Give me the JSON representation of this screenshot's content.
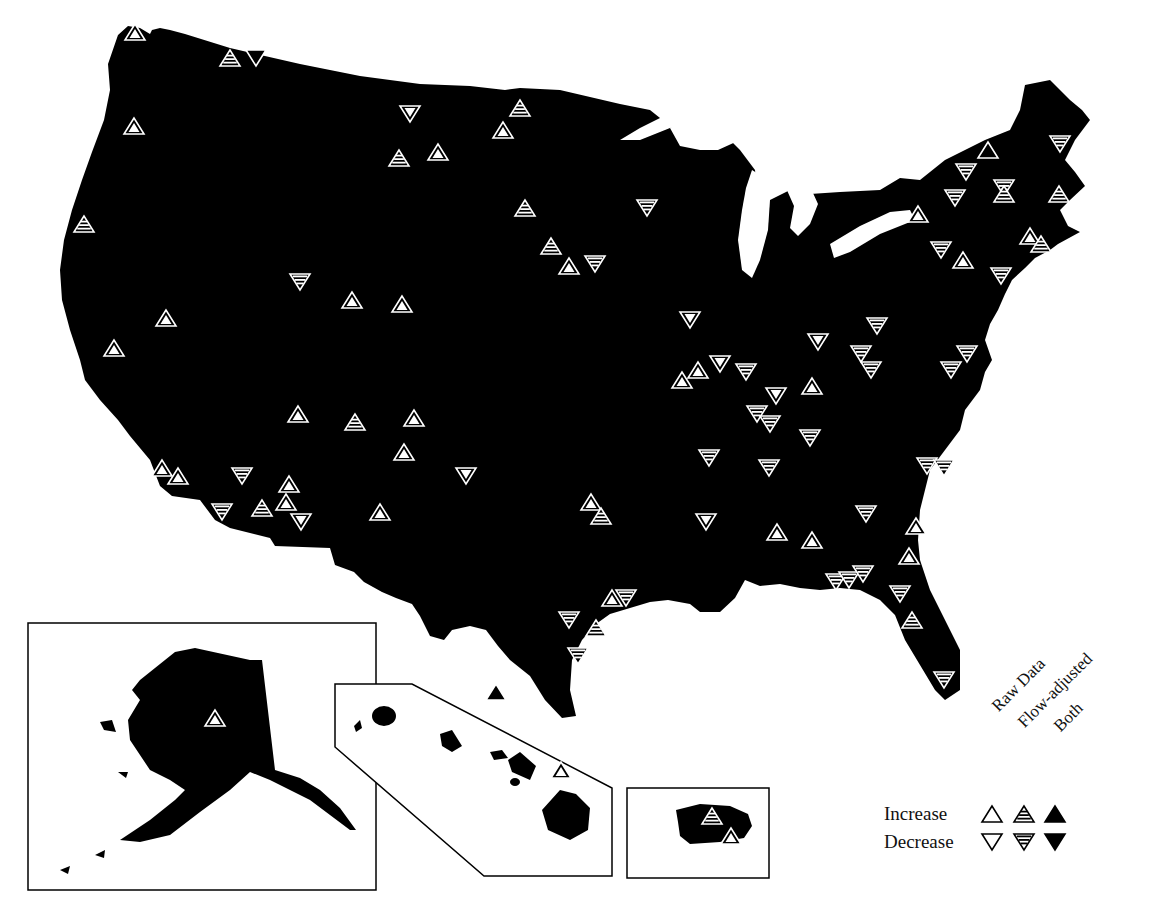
{
  "figure": {
    "type": "map",
    "region": "United States (with Alaska and Hawaii insets)"
  },
  "legend": {
    "columns": [
      "Raw Data",
      "Flow-adjusted",
      "Both"
    ],
    "rows": [
      "Increase",
      "Decrease"
    ]
  },
  "colors": {
    "land": "#000000",
    "background": "#ffffff",
    "marker_outline": "#ffffff"
  },
  "markers": [
    {
      "x": 135,
      "y": 32,
      "dir": "up",
      "kind": "raw"
    },
    {
      "x": 230,
      "y": 58,
      "dir": "up",
      "kind": "flow"
    },
    {
      "x": 256,
      "y": 58,
      "dir": "down",
      "kind": "both"
    },
    {
      "x": 134,
      "y": 126,
      "dir": "up",
      "kind": "raw"
    },
    {
      "x": 84,
      "y": 224,
      "dir": "up",
      "kind": "flow"
    },
    {
      "x": 410,
      "y": 114,
      "dir": "down",
      "kind": "raw"
    },
    {
      "x": 520,
      "y": 108,
      "dir": "up",
      "kind": "flow"
    },
    {
      "x": 503,
      "y": 130,
      "dir": "up",
      "kind": "raw"
    },
    {
      "x": 399,
      "y": 158,
      "dir": "up",
      "kind": "flow"
    },
    {
      "x": 438,
      "y": 152,
      "dir": "up",
      "kind": "raw"
    },
    {
      "x": 525,
      "y": 208,
      "dir": "up",
      "kind": "flow"
    },
    {
      "x": 647,
      "y": 208,
      "dir": "down",
      "kind": "flow"
    },
    {
      "x": 551,
      "y": 246,
      "dir": "up",
      "kind": "flow"
    },
    {
      "x": 569,
      "y": 266,
      "dir": "up",
      "kind": "raw"
    },
    {
      "x": 595,
      "y": 264,
      "dir": "down",
      "kind": "flow"
    },
    {
      "x": 300,
      "y": 282,
      "dir": "down",
      "kind": "flow"
    },
    {
      "x": 352,
      "y": 300,
      "dir": "up",
      "kind": "raw"
    },
    {
      "x": 402,
      "y": 304,
      "dir": "up",
      "kind": "raw"
    },
    {
      "x": 166,
      "y": 318,
      "dir": "up",
      "kind": "raw"
    },
    {
      "x": 114,
      "y": 348,
      "dir": "up",
      "kind": "raw"
    },
    {
      "x": 298,
      "y": 414,
      "dir": "up",
      "kind": "raw"
    },
    {
      "x": 355,
      "y": 422,
      "dir": "up",
      "kind": "flow"
    },
    {
      "x": 414,
      "y": 418,
      "dir": "up",
      "kind": "raw"
    },
    {
      "x": 404,
      "y": 452,
      "dir": "up",
      "kind": "raw"
    },
    {
      "x": 466,
      "y": 476,
      "dir": "down",
      "kind": "raw"
    },
    {
      "x": 162,
      "y": 468,
      "dir": "up",
      "kind": "raw"
    },
    {
      "x": 178,
      "y": 476,
      "dir": "up",
      "kind": "raw"
    },
    {
      "x": 242,
      "y": 476,
      "dir": "down",
      "kind": "flow"
    },
    {
      "x": 289,
      "y": 484,
      "dir": "up",
      "kind": "raw"
    },
    {
      "x": 262,
      "y": 508,
      "dir": "up",
      "kind": "flow"
    },
    {
      "x": 286,
      "y": 502,
      "dir": "up",
      "kind": "raw"
    },
    {
      "x": 222,
      "y": 512,
      "dir": "down",
      "kind": "flow"
    },
    {
      "x": 301,
      "y": 522,
      "dir": "down",
      "kind": "raw"
    },
    {
      "x": 380,
      "y": 512,
      "dir": "up",
      "kind": "raw"
    },
    {
      "x": 690,
      "y": 320,
      "dir": "down",
      "kind": "raw"
    },
    {
      "x": 682,
      "y": 380,
      "dir": "up",
      "kind": "raw"
    },
    {
      "x": 698,
      "y": 370,
      "dir": "up",
      "kind": "raw"
    },
    {
      "x": 720,
      "y": 364,
      "dir": "down",
      "kind": "raw"
    },
    {
      "x": 776,
      "y": 396,
      "dir": "down",
      "kind": "raw"
    },
    {
      "x": 746,
      "y": 372,
      "dir": "down",
      "kind": "flow"
    },
    {
      "x": 812,
      "y": 386,
      "dir": "up",
      "kind": "raw"
    },
    {
      "x": 818,
      "y": 342,
      "dir": "down",
      "kind": "raw"
    },
    {
      "x": 757,
      "y": 414,
      "dir": "down",
      "kind": "flow"
    },
    {
      "x": 770,
      "y": 424,
      "dir": "down",
      "kind": "flow"
    },
    {
      "x": 810,
      "y": 438,
      "dir": "down",
      "kind": "flow"
    },
    {
      "x": 709,
      "y": 458,
      "dir": "down",
      "kind": "flow"
    },
    {
      "x": 769,
      "y": 468,
      "dir": "down",
      "kind": "flow"
    },
    {
      "x": 591,
      "y": 502,
      "dir": "up",
      "kind": "raw"
    },
    {
      "x": 601,
      "y": 516,
      "dir": "up",
      "kind": "flow"
    },
    {
      "x": 706,
      "y": 522,
      "dir": "down",
      "kind": "raw"
    },
    {
      "x": 777,
      "y": 532,
      "dir": "up",
      "kind": "raw"
    },
    {
      "x": 812,
      "y": 540,
      "dir": "up",
      "kind": "raw"
    },
    {
      "x": 866,
      "y": 514,
      "dir": "down",
      "kind": "flow"
    },
    {
      "x": 877,
      "y": 326,
      "dir": "down",
      "kind": "flow"
    },
    {
      "x": 861,
      "y": 354,
      "dir": "down",
      "kind": "flow"
    },
    {
      "x": 871,
      "y": 370,
      "dir": "down",
      "kind": "flow"
    },
    {
      "x": 951,
      "y": 370,
      "dir": "down",
      "kind": "flow"
    },
    {
      "x": 967,
      "y": 354,
      "dir": "down",
      "kind": "flow"
    },
    {
      "x": 927,
      "y": 466,
      "dir": "down",
      "kind": "flow"
    },
    {
      "x": 944,
      "y": 468,
      "dir": "down",
      "kind": "flow"
    },
    {
      "x": 916,
      "y": 526,
      "dir": "up",
      "kind": "raw"
    },
    {
      "x": 909,
      "y": 556,
      "dir": "up",
      "kind": "raw"
    },
    {
      "x": 836,
      "y": 582,
      "dir": "down",
      "kind": "flow"
    },
    {
      "x": 849,
      "y": 580,
      "dir": "down",
      "kind": "flow"
    },
    {
      "x": 863,
      "y": 574,
      "dir": "down",
      "kind": "flow"
    },
    {
      "x": 900,
      "y": 594,
      "dir": "down",
      "kind": "flow"
    },
    {
      "x": 912,
      "y": 620,
      "dir": "up",
      "kind": "flow"
    },
    {
      "x": 944,
      "y": 680,
      "dir": "down",
      "kind": "flow"
    },
    {
      "x": 612,
      "y": 598,
      "dir": "up",
      "kind": "raw"
    },
    {
      "x": 626,
      "y": 598,
      "dir": "down",
      "kind": "flow"
    },
    {
      "x": 569,
      "y": 620,
      "dir": "down",
      "kind": "flow"
    },
    {
      "x": 596,
      "y": 628,
      "dir": "up",
      "kind": "flow"
    },
    {
      "x": 578,
      "y": 656,
      "dir": "down",
      "kind": "flow"
    },
    {
      "x": 988,
      "y": 150,
      "dir": "up",
      "kind": "both"
    },
    {
      "x": 1060,
      "y": 144,
      "dir": "down",
      "kind": "flow"
    },
    {
      "x": 966,
      "y": 172,
      "dir": "down",
      "kind": "flow"
    },
    {
      "x": 955,
      "y": 198,
      "dir": "down",
      "kind": "flow"
    },
    {
      "x": 1004,
      "y": 188,
      "dir": "down",
      "kind": "flow"
    },
    {
      "x": 1004,
      "y": 194,
      "dir": "up",
      "kind": "flow"
    },
    {
      "x": 1059,
      "y": 194,
      "dir": "up",
      "kind": "flow"
    },
    {
      "x": 918,
      "y": 214,
      "dir": "up",
      "kind": "raw"
    },
    {
      "x": 1030,
      "y": 236,
      "dir": "up",
      "kind": "raw"
    },
    {
      "x": 1041,
      "y": 244,
      "dir": "up",
      "kind": "flow"
    },
    {
      "x": 941,
      "y": 250,
      "dir": "down",
      "kind": "flow"
    },
    {
      "x": 963,
      "y": 260,
      "dir": "up",
      "kind": "raw"
    },
    {
      "x": 1001,
      "y": 276,
      "dir": "down",
      "kind": "flow"
    },
    {
      "x": 215,
      "y": 718,
      "dir": "up",
      "kind": "raw"
    },
    {
      "x": 496,
      "y": 692,
      "dir": "up",
      "kind": "both"
    },
    {
      "x": 561,
      "y": 770,
      "dir": "up",
      "kind": "raw"
    },
    {
      "x": 712,
      "y": 816,
      "dir": "up",
      "kind": "flow"
    },
    {
      "x": 731,
      "y": 836,
      "dir": "up",
      "kind": "raw"
    }
  ]
}
